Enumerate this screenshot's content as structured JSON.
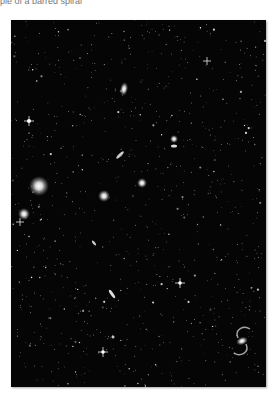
{
  "caption": "ple of a barred spiral",
  "photo": {
    "subject": "deep-sky field of galaxies and stars",
    "background_color": "#050505",
    "galaxies": [
      {
        "name": "elliptical-upper",
        "x": 113,
        "y": 69,
        "w": 8,
        "h": 13,
        "rot": 10
      },
      {
        "name": "bright-elliptical-left",
        "x": 28,
        "y": 166,
        "w": 16,
        "h": 14,
        "rot": 0
      },
      {
        "name": "small-left",
        "x": 13,
        "y": 195,
        "w": 9,
        "h": 9,
        "rot": 0
      },
      {
        "name": "center-round",
        "x": 93,
        "y": 175,
        "w": 9,
        "h": 9,
        "rot": 0
      },
      {
        "name": "center-right-round",
        "x": 128,
        "y": 161,
        "w": 7,
        "h": 7,
        "rot": 0
      },
      {
        "name": "right-pair-a",
        "x": 160,
        "y": 116,
        "w": 6,
        "h": 6,
        "rot": 0
      },
      {
        "name": "right-pair-b",
        "x": 160,
        "y": 124,
        "w": 6,
        "h": 3,
        "rot": 0
      },
      {
        "name": "edge-on-center",
        "x": 108,
        "y": 131,
        "w": 3,
        "h": 9,
        "rot": 45
      },
      {
        "name": "edge-on-lower",
        "x": 100,
        "y": 269,
        "w": 3,
        "h": 9,
        "rot": -35
      },
      {
        "name": "small-edge-mid",
        "x": 82,
        "y": 219,
        "w": 3,
        "h": 6,
        "rot": -40
      }
    ],
    "barred_spiral": {
      "x": 230,
      "y": 320
    }
  }
}
